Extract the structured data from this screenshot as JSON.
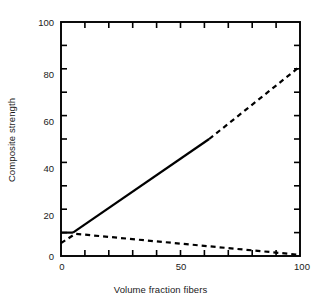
{
  "chart_data": {
    "type": "line",
    "title": "",
    "xlabel": "Volume fraction fibers",
    "ylabel": "Composite strength",
    "xlim": [
      0,
      100
    ],
    "ylim": [
      0,
      100
    ],
    "xticks": [
      0,
      10,
      20,
      30,
      40,
      50,
      60,
      70,
      80,
      90,
      100
    ],
    "yticks": [
      0,
      10,
      20,
      30,
      40,
      50,
      60,
      70,
      80,
      90,
      100
    ],
    "xticklabels": [
      "0",
      "50",
      "100"
    ],
    "xticklabel_values": [
      0,
      50,
      100
    ],
    "yticklabels": [
      "0",
      "20",
      "40",
      "60",
      "80",
      "100"
    ],
    "yticklabel_values": [
      0,
      20,
      40,
      60,
      80,
      100
    ],
    "grid": false,
    "legend": "none",
    "frame": "box",
    "series": [
      {
        "name": "matrix-controlled plateau",
        "style": "solid",
        "linewidth": 2.2,
        "x": [
          0,
          5
        ],
        "values": [
          10,
          10
        ]
      },
      {
        "name": "fiber-controlled rise (solid segment)",
        "style": "solid",
        "linewidth": 2.2,
        "x": [
          5,
          62
        ],
        "values": [
          10,
          50
        ]
      },
      {
        "name": "fiber-controlled rise (dashed extrapolation)",
        "style": "dashed",
        "linewidth": 2.2,
        "x": [
          62,
          100
        ],
        "values": [
          50,
          81
        ]
      },
      {
        "name": "matrix-controlled decline (dashed extrapolation)",
        "style": "dashed",
        "linewidth": 2.2,
        "x": [
          0,
          6,
          100
        ],
        "values": [
          5.5,
          9.5,
          0.5
        ]
      }
    ]
  },
  "axes_geometry": {
    "left_px": 61,
    "right_px": 300,
    "top_px": 22,
    "bottom_px": 256
  },
  "colors": {
    "line": "#000000",
    "axis": "#000000",
    "text": "#1a1a1a",
    "background": "#ffffff"
  },
  "ticklabels": {
    "y": {
      "v100": "100",
      "v80": "80",
      "v60": "60",
      "v40": "40",
      "v20": "20",
      "v0": "0"
    },
    "x": {
      "v0": "0",
      "v50": "50",
      "v100": "100"
    }
  }
}
